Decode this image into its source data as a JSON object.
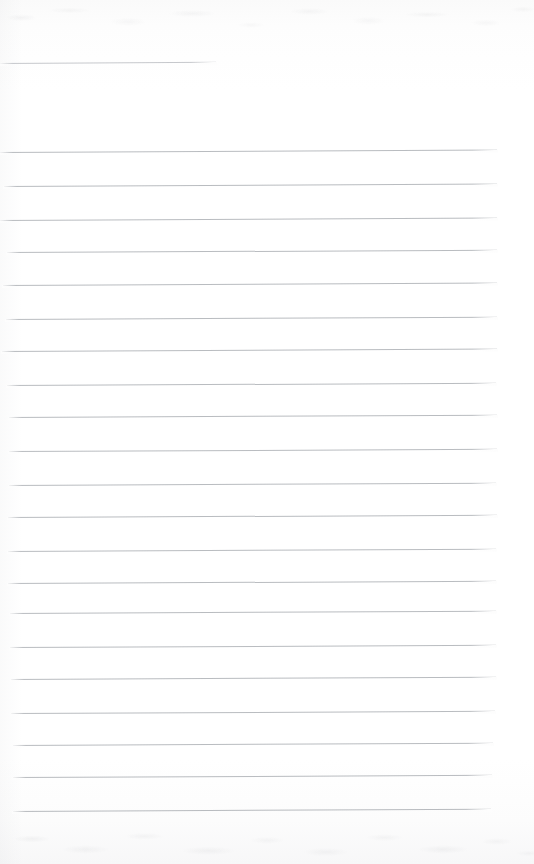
{
  "document": {
    "kind": "scanned-blank-ruled-page",
    "page_width": 534,
    "page_height": 864,
    "paper_color": "#fdfdfd",
    "rule_color": "#787e86",
    "text_content": "",
    "visible_text": [],
    "notes": "Blank scanned notebook / ledger page. No printed or handwritten text is visible anywhere in the image."
  },
  "header_rule": {
    "name": "title-underline",
    "x": 0,
    "y": 63,
    "width": 216,
    "tilt_deg": -0.35,
    "thickness": 1
  },
  "ruled_lines": {
    "count": 21,
    "spacing_px": 33,
    "first_y": 152,
    "last_y": 811,
    "left_x": 9,
    "right_x": 496,
    "tilt_deg": -0.28,
    "lines": [
      {
        "index": 1,
        "y": 152,
        "x": 0,
        "width": 497,
        "tilt_deg": -0.3
      },
      {
        "index": 2,
        "y": 186,
        "x": 4,
        "width": 493,
        "tilt_deg": -0.28
      },
      {
        "index": 3,
        "y": 220,
        "x": 0,
        "width": 497,
        "tilt_deg": -0.3
      },
      {
        "index": 4,
        "y": 252,
        "x": 7,
        "width": 490,
        "tilt_deg": -0.26
      },
      {
        "index": 5,
        "y": 285,
        "x": 3,
        "width": 494,
        "tilt_deg": -0.28
      },
      {
        "index": 6,
        "y": 319,
        "x": 6,
        "width": 491,
        "tilt_deg": -0.27
      },
      {
        "index": 7,
        "y": 351,
        "x": 2,
        "width": 495,
        "tilt_deg": -0.29
      },
      {
        "index": 8,
        "y": 385,
        "x": 7,
        "width": 489,
        "tilt_deg": -0.26
      },
      {
        "index": 9,
        "y": 417,
        "x": 9,
        "width": 488,
        "tilt_deg": -0.27
      },
      {
        "index": 10,
        "y": 451,
        "x": 9,
        "width": 488,
        "tilt_deg": -0.26
      },
      {
        "index": 11,
        "y": 485,
        "x": 9,
        "width": 487,
        "tilt_deg": -0.27
      },
      {
        "index": 12,
        "y": 517,
        "x": 8,
        "width": 489,
        "tilt_deg": -0.26
      },
      {
        "index": 13,
        "y": 551,
        "x": 8,
        "width": 488,
        "tilt_deg": -0.27
      },
      {
        "index": 14,
        "y": 583,
        "x": 8,
        "width": 488,
        "tilt_deg": -0.26
      },
      {
        "index": 15,
        "y": 613,
        "x": 10,
        "width": 486,
        "tilt_deg": -0.27
      },
      {
        "index": 16,
        "y": 647,
        "x": 10,
        "width": 486,
        "tilt_deg": -0.26
      },
      {
        "index": 17,
        "y": 679,
        "x": 11,
        "width": 485,
        "tilt_deg": -0.27
      },
      {
        "index": 18,
        "y": 713,
        "x": 11,
        "width": 484,
        "tilt_deg": -0.26
      },
      {
        "index": 19,
        "y": 745,
        "x": 13,
        "width": 480,
        "tilt_deg": -0.27
      },
      {
        "index": 20,
        "y": 777,
        "x": 13,
        "width": 479,
        "tilt_deg": -0.26
      },
      {
        "index": 21,
        "y": 811,
        "x": 13,
        "width": 478,
        "tilt_deg": -0.27
      }
    ]
  }
}
